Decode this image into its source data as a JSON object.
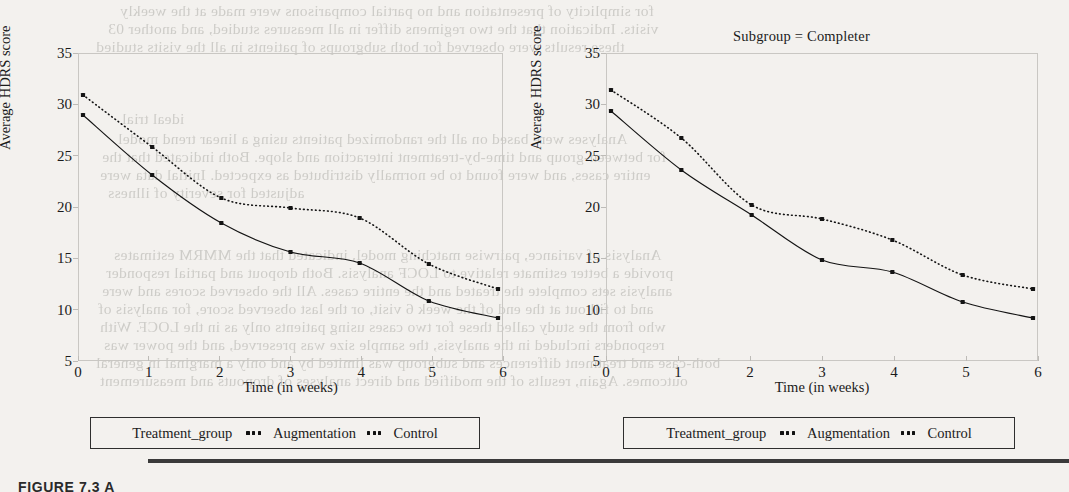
{
  "figure": {
    "caption": "FIGURE 7.3 A",
    "bleed_lines": [
      {
        "text": "for simplicity of presentation and no partial comparisons were made at the weekly",
        "x": 120,
        "y": 2
      },
      {
        "text": "visits. Indication that the two regimens differ in all measures studied, and another 03",
        "x": 108,
        "y": 20
      },
      {
        "text": "these results were observed for both subgroups of patients in all the visits studied",
        "x": 96,
        "y": 38
      },
      {
        "text": "ideal trial",
        "x": 122,
        "y": 110
      },
      {
        "text": "Analyses were based on all the randomized patients using a linear trend model",
        "x": 118,
        "y": 130
      },
      {
        "text": "for between-group and time-by-treatment interaction and slope. Both indicated that the",
        "x": 102,
        "y": 148
      },
      {
        "text": "entire cases, and were found to be normally distributed as expected. Initial data were",
        "x": 100,
        "y": 166
      },
      {
        "text": "adjusted for severity of illness",
        "x": 108,
        "y": 184
      },
      {
        "text": "Analysis of variance, pairwise matching model, indicated that the MMRM estimates",
        "x": 114,
        "y": 246
      },
      {
        "text": "provide a better estimate relative to LOCF analysis. Both dropout and partial responder",
        "x": 106,
        "y": 264
      },
      {
        "text": "analysis sets complete the treated and the entire cases. All the observed scores and were",
        "x": 102,
        "y": 282
      },
      {
        "text": "and to fill out at the end of the week 6 visit, or the last observed score, for analysis of",
        "x": 98,
        "y": 300
      },
      {
        "text": "who from the study called these for two cases using patients only as in the LOCF. With",
        "x": 100,
        "y": 318
      },
      {
        "text": "responders included in the analysis, the sample size was preserved, and the power was",
        "x": 104,
        "y": 336
      },
      {
        "text": "both-case and treatment differences and subgroup was limited by and only a marginal in general",
        "x": 96,
        "y": 354
      },
      {
        "text": "outcomes. Again, results of the modified and direct analyses of dropouts and measurement",
        "x": 100,
        "y": 372
      }
    ]
  },
  "panels": [
    {
      "id": "left",
      "title": "",
      "chart_key": 0
    },
    {
      "id": "right",
      "title": "Subgroup = Completer",
      "chart_key": 1
    }
  ],
  "legend": {
    "title": "Treatment_group",
    "entries": [
      {
        "label": "Augmentation",
        "marker": "dotted-marker-icon"
      },
      {
        "label": "Control",
        "marker": "dotted-marker-icon"
      }
    ]
  },
  "chart_data": [
    {
      "type": "line",
      "title": "",
      "xlabel": "Time (in weeks)",
      "ylabel": "Average HDRS score",
      "x": [
        0,
        1,
        2,
        3,
        4,
        5,
        6
      ],
      "xticks": [
        "0",
        "1",
        "2",
        "3",
        "4",
        "5",
        "6"
      ],
      "yticks": [
        "5",
        "10",
        "15",
        "20",
        "25",
        "30",
        "35"
      ],
      "xlim": [
        0,
        6
      ],
      "ylim": [
        5,
        35
      ],
      "grid": false,
      "legend_position": "below",
      "series": [
        {
          "name": "Augmentation",
          "style": "dotted",
          "color": "#141414",
          "values": [
            31.2,
            26.0,
            20.9,
            19.9,
            18.9,
            14.3,
            11.8
          ]
        },
        {
          "name": "Control",
          "style": "solid",
          "color": "#141414",
          "values": [
            29.2,
            23.2,
            18.4,
            15.5,
            14.4,
            10.6,
            8.9
          ]
        }
      ]
    },
    {
      "type": "line",
      "title": "Subgroup = Completer",
      "xlabel": "Time (in weeks)",
      "ylabel": "Average HDRS score",
      "x": [
        0,
        1,
        2,
        3,
        4,
        5,
        6
      ],
      "xticks": [
        "0",
        "1",
        "2",
        "3",
        "4",
        "5",
        "6"
      ],
      "yticks": [
        "5",
        "10",
        "15",
        "20",
        "25",
        "30",
        "35"
      ],
      "xlim": [
        0,
        6
      ],
      "ylim": [
        5,
        35
      ],
      "grid": false,
      "legend_position": "below",
      "series": [
        {
          "name": "Augmentation",
          "style": "dotted",
          "color": "#141414",
          "values": [
            31.7,
            26.9,
            20.2,
            18.8,
            16.7,
            13.2,
            11.8
          ]
        },
        {
          "name": "Control",
          "style": "solid",
          "color": "#141414",
          "values": [
            29.6,
            23.7,
            19.2,
            14.7,
            13.5,
            10.5,
            8.9
          ]
        }
      ]
    }
  ]
}
